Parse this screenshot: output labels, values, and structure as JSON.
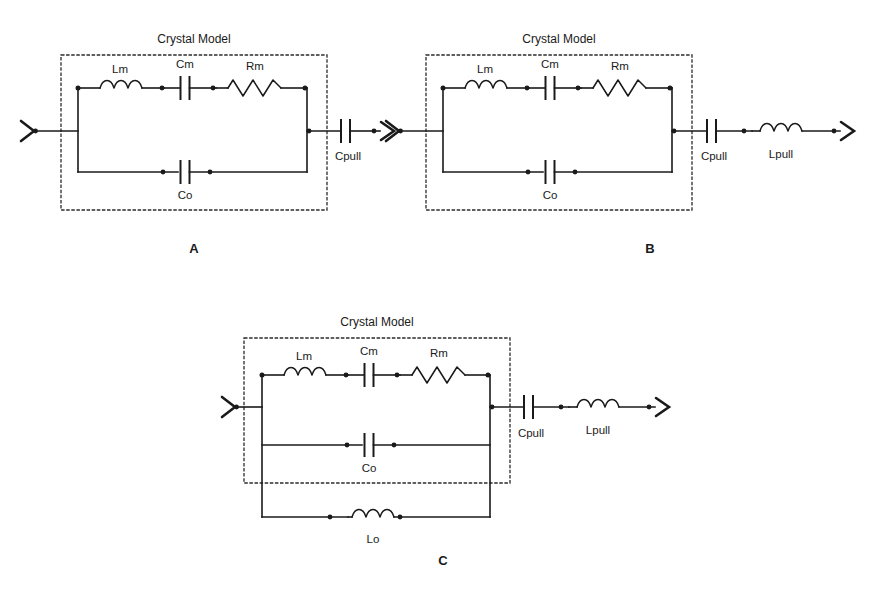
{
  "page": {
    "background": "#ffffff",
    "ink": "#1a1a1a",
    "width": 891,
    "height": 593
  },
  "figures": [
    {
      "id": "A",
      "caption": "A",
      "box_title": "Crystal Model",
      "components": {
        "motional_inductor": "Lm",
        "motional_capacitor": "Cm",
        "motional_resistor": "Rm",
        "shunt_capacitor": "Co",
        "pull_capacitor": "Cpull"
      },
      "branches": [
        "Lm-Cm-Rm series arm",
        "Co shunt arm"
      ],
      "external": [
        "Cpull"
      ]
    },
    {
      "id": "B",
      "caption": "B",
      "box_title": "Crystal Model",
      "components": {
        "motional_inductor": "Lm",
        "motional_capacitor": "Cm",
        "motional_resistor": "Rm",
        "shunt_capacitor": "Co",
        "pull_capacitor": "Cpull",
        "pull_inductor": "Lpull"
      },
      "branches": [
        "Lm-Cm-Rm series arm",
        "Co shunt arm"
      ],
      "external": [
        "Cpull",
        "Lpull"
      ]
    },
    {
      "id": "C",
      "caption": "C",
      "box_title": "Crystal Model",
      "components": {
        "motional_inductor": "Lm",
        "motional_capacitor": "Cm",
        "motional_resistor": "Rm",
        "shunt_capacitor": "Co",
        "shunt_inductor": "Lo",
        "pull_capacitor": "Cpull",
        "pull_inductor": "Lpull"
      },
      "branches": [
        "Lm-Cm-Rm series arm",
        "Co shunt arm",
        "Lo shunt arm"
      ],
      "external": [
        "Cpull",
        "Lpull"
      ]
    }
  ],
  "labels": {
    "crystal_model": "Crystal Model",
    "lm": "Lm",
    "cm": "Cm",
    "rm": "Rm",
    "co": "Co",
    "lo": "Lo",
    "cpull": "Cpull",
    "lpull": "Lpull",
    "fig_a": "A",
    "fig_b": "B",
    "fig_c": "C"
  }
}
